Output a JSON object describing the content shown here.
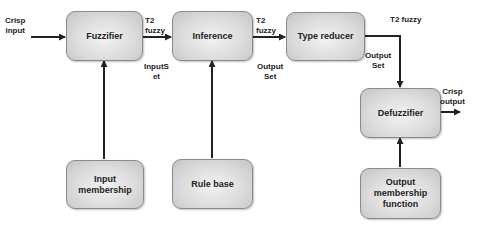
{
  "diagram": {
    "blocks": {
      "fuzzifier": "Fuzzifier",
      "inference": "Inference",
      "type_reducer": "Type reducer",
      "defuzzifier": "Defuzzifier",
      "input_membership": "Input membership",
      "rule_base": "Rule base",
      "output_membership": "Output membership function"
    },
    "labels": {
      "crisp_input_1": "Crisp",
      "crisp_input_2": "input",
      "t2_fuzzy_1a": "T2",
      "t2_fuzzy_1b": "fuzzy",
      "input_set_1": "InputS",
      "input_set_2": "et",
      "t2_fuzzy_2a": "T2",
      "t2_fuzzy_2b": "fuzzy",
      "output_set_1a": "Output",
      "output_set_1b": "Set",
      "t2_fuzzy_3": "T2 fuzzy",
      "output_set_2a": "Output",
      "output_set_2b": "Set",
      "crisp_output_1": "Crisp",
      "crisp_output_2": "output"
    },
    "edges": [
      {
        "from": "crisp-input",
        "to": "fuzzifier"
      },
      {
        "from": "fuzzifier",
        "to": "inference"
      },
      {
        "from": "inference",
        "to": "type_reducer"
      },
      {
        "from": "type_reducer",
        "to": "defuzzifier"
      },
      {
        "from": "defuzzifier",
        "to": "crisp-output"
      },
      {
        "from": "input_membership",
        "to": "fuzzifier"
      },
      {
        "from": "rule_base",
        "to": "inference"
      },
      {
        "from": "output_membership",
        "to": "defuzzifier"
      }
    ]
  }
}
